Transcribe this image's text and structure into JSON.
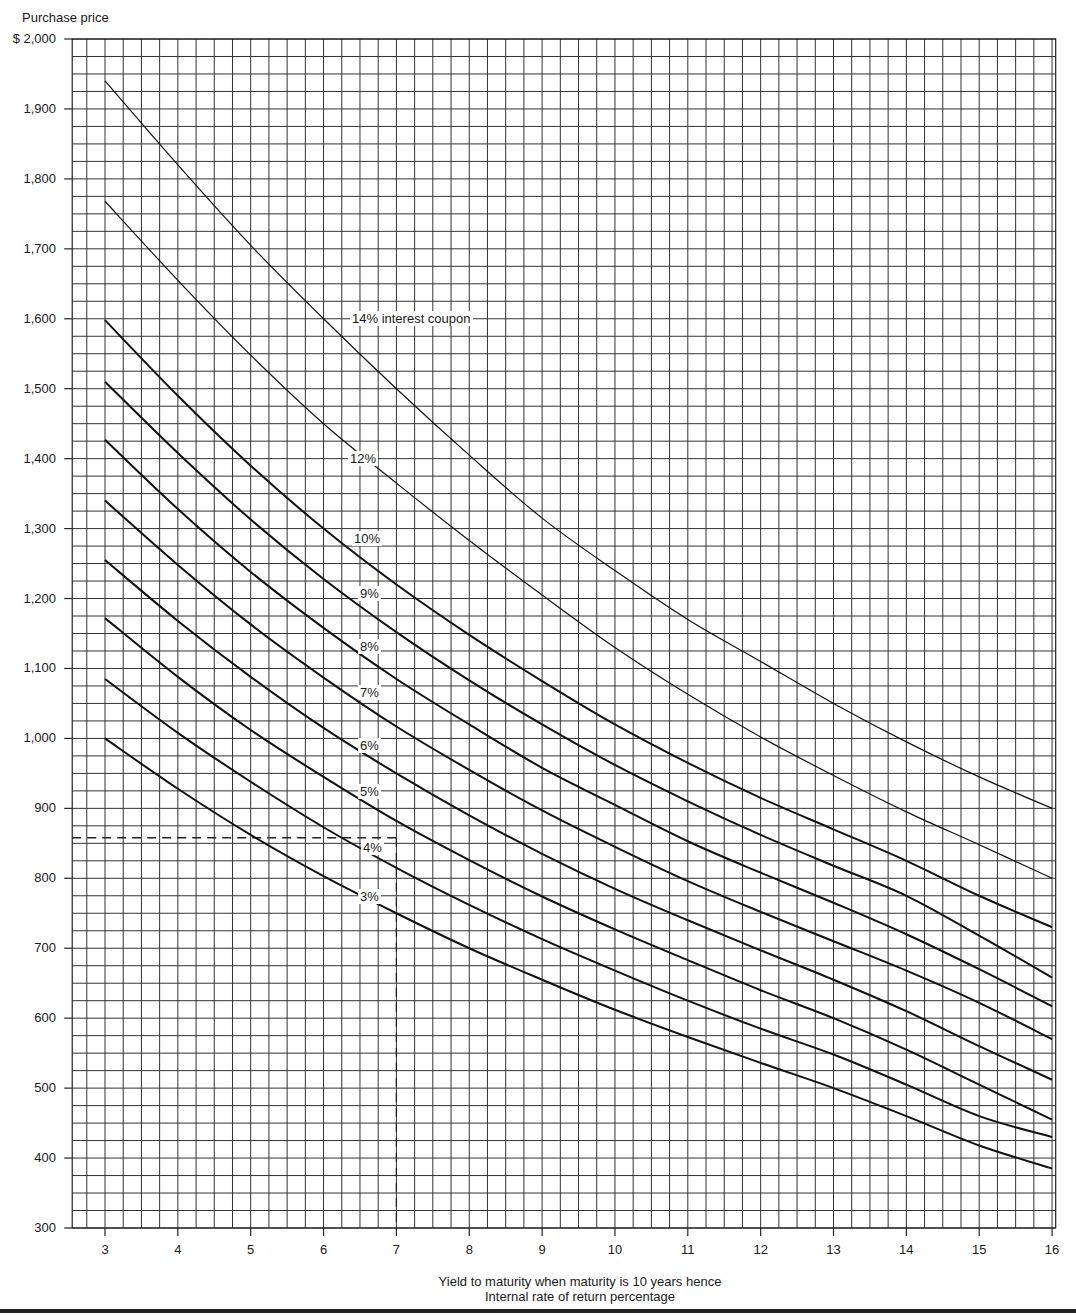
{
  "chart_data": {
    "type": "line",
    "title": "",
    "ylabel_top": "Purchase price",
    "xlabel_line1": "Yield to maturity when maturity is 10 years hence",
    "xlabel_line2": "Internal rate of return percentage",
    "xlim": [
      2.55,
      16.05
    ],
    "ylim": [
      300,
      2000
    ],
    "grid": true,
    "grid_minor_x": 0.25,
    "grid_minor_y": 25,
    "x_ticks": [
      "3",
      "4",
      "5",
      "6",
      "7",
      "8",
      "9",
      "10",
      "11",
      "12",
      "13",
      "14",
      "15",
      "16"
    ],
    "y_ticks": [
      {
        "value": 2000,
        "label": "$ 2,000"
      },
      {
        "value": 1900,
        "label": "1,900"
      },
      {
        "value": 1800,
        "label": "1,800"
      },
      {
        "value": 1700,
        "label": "1,700"
      },
      {
        "value": 1600,
        "label": "1,600"
      },
      {
        "value": 1500,
        "label": "1,500"
      },
      {
        "value": 1400,
        "label": "1,400"
      },
      {
        "value": 1300,
        "label": "1,300"
      },
      {
        "value": 1200,
        "label": "1,200"
      },
      {
        "value": 1100,
        "label": "1,100"
      },
      {
        "value": 1000,
        "label": "1,000"
      },
      {
        "value": 900,
        "label": "900"
      },
      {
        "value": 800,
        "label": "800"
      },
      {
        "value": 700,
        "label": "700"
      },
      {
        "value": 600,
        "label": "600"
      },
      {
        "value": 500,
        "label": "500"
      },
      {
        "value": 400,
        "label": "400"
      },
      {
        "value": 300,
        "label": "300"
      }
    ],
    "x": [
      3,
      4,
      5,
      6,
      7,
      8,
      9,
      10,
      11,
      12,
      13,
      14,
      15,
      16
    ],
    "series": [
      {
        "name": "14% interest coupon",
        "label": "14% interest coupon",
        "stroke": 1.2,
        "label_x": 6.35,
        "label_y": 1600,
        "values": [
          1940,
          1820,
          1705,
          1600,
          1500,
          1405,
          1315,
          1240,
          1170,
          1110,
          1050,
          995,
          945,
          900
        ]
      },
      {
        "name": "12%",
        "label": "12%",
        "stroke": 1.2,
        "label_x": 6.35,
        "label_y": 1400,
        "values": [
          1768,
          1655,
          1548,
          1450,
          1365,
          1283,
          1205,
          1130,
          1063,
          1002,
          947,
          895,
          848,
          800
        ]
      },
      {
        "name": "10%",
        "label": "10%",
        "stroke": 2,
        "label_x": 6.35,
        "label_y": 1290,
        "values": [
          1598,
          1490,
          1390,
          1300,
          1220,
          1148,
          1082,
          1020,
          965,
          915,
          870,
          825,
          775,
          730
        ]
      },
      {
        "name": "9%",
        "label": "9%",
        "stroke": 2,
        "label_x": 6.35,
        "label_y": 1210,
        "values": [
          1510,
          1408,
          1313,
          1228,
          1152,
          1083,
          1020,
          962,
          910,
          862,
          818,
          775,
          718,
          658
        ]
      },
      {
        "name": "8%",
        "label": "8%",
        "stroke": 2,
        "label_x": 6.35,
        "label_y": 1135,
        "values": [
          1427,
          1328,
          1238,
          1158,
          1085,
          1020,
          958,
          905,
          853,
          808,
          765,
          720,
          670,
          617
        ]
      },
      {
        "name": "7%",
        "label": "7%",
        "stroke": 2,
        "label_x": 6.35,
        "label_y": 1060,
        "values": [
          1340,
          1248,
          1163,
          1087,
          1017,
          955,
          897,
          845,
          796,
          752,
          710,
          668,
          622,
          570
        ]
      },
      {
        "name": "6%",
        "label": "6%",
        "stroke": 2,
        "label_x": 6.35,
        "label_y": 985,
        "values": [
          1255,
          1168,
          1088,
          1015,
          950,
          890,
          835,
          785,
          740,
          697,
          655,
          610,
          560,
          512
        ]
      },
      {
        "name": "5%",
        "label": "5%",
        "stroke": 2,
        "label_x": 6.35,
        "label_y": 915,
        "values": [
          1172,
          1088,
          1012,
          945,
          882,
          826,
          774,
          727,
          683,
          640,
          600,
          555,
          505,
          455
        ]
      },
      {
        "name": "4%",
        "label": "4%",
        "stroke": 2,
        "label_x": 6.35,
        "label_y": 840,
        "values": [
          1085,
          1008,
          938,
          873,
          815,
          762,
          713,
          668,
          625,
          585,
          548,
          505,
          460,
          430
        ]
      },
      {
        "name": "3%",
        "label": "3%",
        "stroke": 2,
        "label_x": 6.35,
        "label_y": 765,
        "values": [
          1000,
          928,
          862,
          803,
          750,
          700,
          655,
          612,
          573,
          536,
          500,
          460,
          418,
          385
        ]
      }
    ],
    "annotations": [
      {
        "type": "dashed-guide",
        "x": 7.0,
        "y": 858,
        "description": "Dashed lines from $858 on price axis to 7% yield"
      }
    ]
  }
}
